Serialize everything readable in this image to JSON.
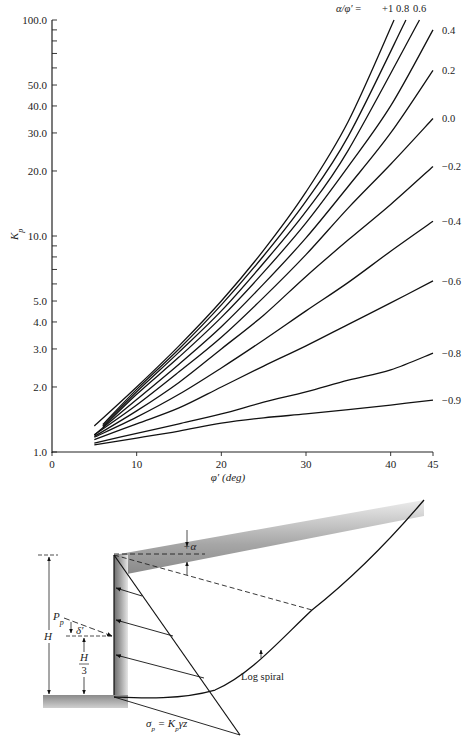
{
  "chart_data": {
    "type": "line",
    "title": "",
    "xlabel": "φ′ (deg)",
    "ylabel": "Kp",
    "xlim": [
      0,
      45
    ],
    "ylim": [
      1.0,
      100.0
    ],
    "yscale": "log",
    "grid": false,
    "legend_title": "α/φ′ =",
    "x_ticks": [
      "0",
      "10",
      "20",
      "30",
      "40",
      "45"
    ],
    "y_ticks": [
      "1.0",
      "2.0",
      "3.0",
      "4.0",
      "5.0",
      "10.0",
      "20.0",
      "30.0",
      "40.0",
      "50.0",
      "100.0"
    ],
    "series": [
      {
        "name": "+1",
        "x": [
          5,
          10,
          15,
          20,
          25,
          30,
          35,
          40.4
        ],
        "values": [
          1.32,
          2.0,
          3.1,
          5.0,
          8.6,
          16.0,
          34.0,
          100.0
        ]
      },
      {
        "name": "0.8",
        "x": [
          6,
          10,
          15,
          20,
          25,
          30,
          35,
          41.8
        ],
        "values": [
          1.34,
          1.95,
          3.0,
          4.8,
          8.1,
          14.5,
          29.0,
          100.0
        ]
      },
      {
        "name": "0.6",
        "x": [
          6,
          10,
          15,
          20,
          25,
          30,
          35,
          43.4
        ],
        "values": [
          1.32,
          1.9,
          2.9,
          4.5,
          7.5,
          13.0,
          25.0,
          100.0
        ]
      },
      {
        "name": "0.4",
        "x": [
          6,
          10,
          15,
          20,
          25,
          30,
          35,
          40,
          45
        ],
        "values": [
          1.3,
          1.85,
          2.75,
          4.2,
          6.8,
          11.5,
          21.0,
          40.0,
          90.0
        ]
      },
      {
        "name": "0.2",
        "x": [
          5,
          10,
          15,
          20,
          25,
          30,
          35,
          40,
          45
        ],
        "values": [
          1.2,
          1.75,
          2.55,
          3.8,
          6.0,
          9.8,
          17.0,
          30.0,
          58.5
        ]
      },
      {
        "name": "0.0",
        "x": [
          5,
          10,
          15,
          20,
          25,
          30,
          35,
          40,
          45
        ],
        "values": [
          1.2,
          1.65,
          2.35,
          3.4,
          5.2,
          8.2,
          13.5,
          21.5,
          35.0
        ]
      },
      {
        "name": "-0.2",
        "x": [
          5,
          10,
          15,
          20,
          25,
          30,
          35,
          40,
          45
        ],
        "values": [
          1.18,
          1.55,
          2.1,
          3.0,
          4.3,
          6.5,
          9.6,
          14.0,
          21.0
        ]
      },
      {
        "name": "-0.4",
        "x": [
          5,
          10,
          15,
          20,
          25,
          30,
          35,
          40,
          45
        ],
        "values": [
          1.17,
          1.45,
          1.85,
          2.45,
          3.3,
          4.5,
          6.1,
          8.5,
          11.7
        ]
      },
      {
        "name": "-0.6",
        "x": [
          5,
          10,
          15,
          20,
          25,
          30,
          35,
          40,
          45
        ],
        "values": [
          1.14,
          1.35,
          1.6,
          2.0,
          2.5,
          3.1,
          3.9,
          4.9,
          6.2
        ]
      },
      {
        "name": "-0.8",
        "x": [
          5,
          10,
          15,
          20,
          25,
          30,
          35,
          40,
          45
        ],
        "values": [
          1.1,
          1.22,
          1.35,
          1.5,
          1.7,
          1.9,
          2.15,
          2.4,
          2.87
        ]
      },
      {
        "name": "-0.9",
        "x": [
          5,
          10,
          15,
          20,
          25,
          30,
          35,
          40,
          45
        ],
        "values": [
          1.08,
          1.16,
          1.25,
          1.36,
          1.44,
          1.5,
          1.57,
          1.65,
          1.74
        ]
      }
    ],
    "curve_labels": [
      "+1",
      "0.8",
      "0.6",
      "0.4",
      "0.2",
      "0.0",
      "−0.2",
      "−0.4",
      "−0.6",
      "−0.8",
      "−0.9"
    ]
  },
  "diagram": {
    "labels": {
      "alpha": "+α",
      "height": "H",
      "passive_force": "Pp",
      "delta": "δ′",
      "lever_num": "H",
      "lever_den": "3",
      "log_spiral": "Log spiral",
      "stress": "σp = Kpγz"
    }
  }
}
